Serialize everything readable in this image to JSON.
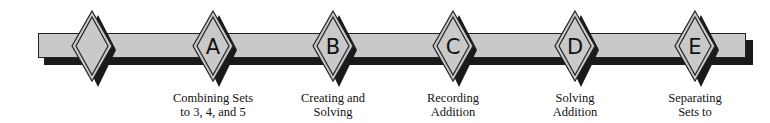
{
  "diagram": {
    "type": "timeline",
    "colors": {
      "bar_fill": "#c9c9c9",
      "shadow": "#1a1a1a",
      "outline": "#222222",
      "diamond_fill": "#c9c9c9",
      "background": "#ffffff"
    },
    "nodes": [
      {
        "letter": "",
        "caption_line1": "",
        "caption_line2": ""
      },
      {
        "letter": "A",
        "caption_line1": "Combining Sets",
        "caption_line2": "to 3, 4, and 5"
      },
      {
        "letter": "B",
        "caption_line1": "Creating and",
        "caption_line2": "Solving"
      },
      {
        "letter": "C",
        "caption_line1": "Recording",
        "caption_line2": "Addition"
      },
      {
        "letter": "D",
        "caption_line1": "Solving",
        "caption_line2": "Addition"
      },
      {
        "letter": "E",
        "caption_line1": "Separating",
        "caption_line2": "Sets to"
      }
    ]
  }
}
